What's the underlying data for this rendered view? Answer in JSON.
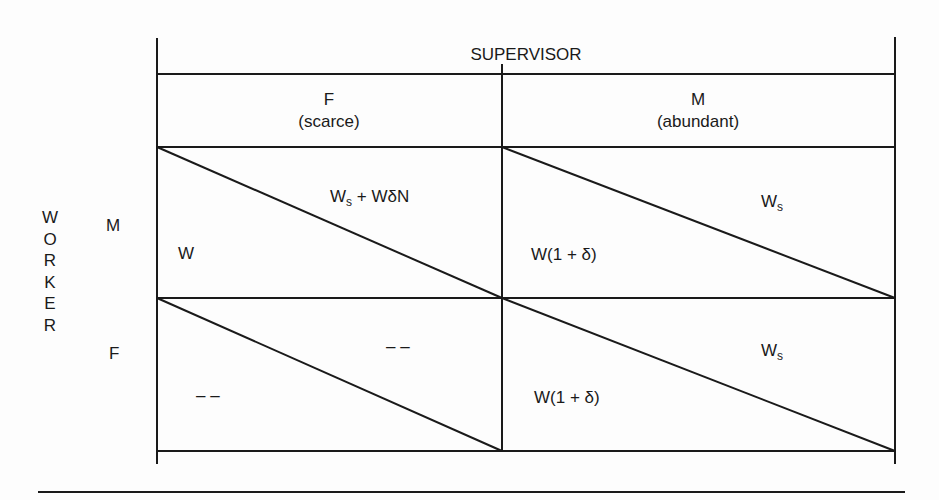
{
  "title": "SUPERVISOR",
  "row_axis_label": "WORKER",
  "row_axis_letters": [
    "W",
    "O",
    "R",
    "K",
    "E",
    "R"
  ],
  "columns": [
    {
      "label": "F",
      "sublabel": "(scarce)"
    },
    {
      "label": "M",
      "sublabel": "(abundant)"
    }
  ],
  "rows": [
    {
      "label": "M"
    },
    {
      "label": "F"
    }
  ],
  "cells": {
    "M_F": {
      "lower_left": "W",
      "upper_right_main": "W",
      "upper_right_sub": "s",
      "upper_right_rest": " + WδN"
    },
    "M_M": {
      "lower_left": "W(1 + δ)",
      "upper_right_main": "W",
      "upper_right_sub": "s"
    },
    "F_F": {
      "lower_left": "– –",
      "upper_right": "– –"
    },
    "F_M": {
      "lower_left": "W(1 + δ)",
      "upper_right_main": "W",
      "upper_right_sub": "s"
    }
  },
  "colors": {
    "line": "#1a1a1a",
    "background": "#fdfdfd"
  }
}
